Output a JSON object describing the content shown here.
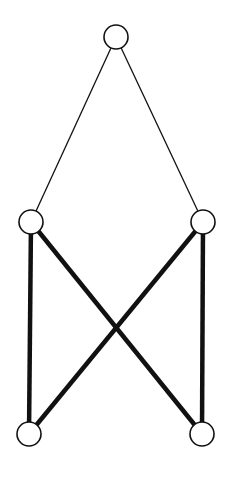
{
  "diagram": {
    "type": "graph",
    "width": 229,
    "height": 478,
    "colors": {
      "background": "#ffffff",
      "stroke": "#111111",
      "node_fill": "#ffffff"
    },
    "node_radius": 12,
    "nodes": [
      {
        "id": "top",
        "x": 116,
        "y": 37
      },
      {
        "id": "mid-left",
        "x": 31,
        "y": 222
      },
      {
        "id": "mid-right",
        "x": 203,
        "y": 222
      },
      {
        "id": "bottom-left",
        "x": 29,
        "y": 434
      },
      {
        "id": "bottom-right",
        "x": 202,
        "y": 434
      }
    ],
    "edges": [
      {
        "from": "top",
        "to": "mid-left",
        "weight": "thin"
      },
      {
        "from": "top",
        "to": "mid-right",
        "weight": "thin"
      },
      {
        "from": "mid-left",
        "to": "bottom-left",
        "weight": "thick"
      },
      {
        "from": "mid-right",
        "to": "bottom-right",
        "weight": "thick"
      },
      {
        "from": "mid-left",
        "to": "bottom-right",
        "weight": "thick"
      },
      {
        "from": "mid-right",
        "to": "bottom-left",
        "weight": "thick"
      }
    ]
  }
}
